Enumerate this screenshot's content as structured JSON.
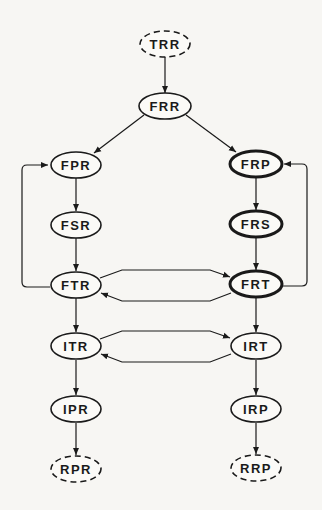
{
  "diagram": {
    "title": "",
    "nodes": [
      {
        "id": "TRR",
        "label": "TRR",
        "cx": 165,
        "cy": 44,
        "style": "dashed"
      },
      {
        "id": "FRR",
        "label": "FRR",
        "cx": 165,
        "cy": 106,
        "style": "normal"
      },
      {
        "id": "FPR",
        "label": "FPR",
        "cx": 75,
        "cy": 165,
        "style": "normal"
      },
      {
        "id": "FRP",
        "label": "FRP",
        "cx": 255,
        "cy": 164,
        "style": "bold"
      },
      {
        "id": "FSR",
        "label": "FSR",
        "cx": 76,
        "cy": 225,
        "style": "normal"
      },
      {
        "id": "FRS",
        "label": "FRS",
        "cx": 256,
        "cy": 224,
        "style": "bold"
      },
      {
        "id": "FTR",
        "label": "FTR",
        "cx": 76,
        "cy": 285,
        "style": "normal"
      },
      {
        "id": "FRT",
        "label": "FRT",
        "cx": 256,
        "cy": 284,
        "style": "bold"
      },
      {
        "id": "ITR",
        "label": "ITR",
        "cx": 76,
        "cy": 346,
        "style": "normal"
      },
      {
        "id": "IRT",
        "label": "IRT",
        "cx": 256,
        "cy": 346,
        "style": "normal"
      },
      {
        "id": "IPR",
        "label": "IPR",
        "cx": 76,
        "cy": 409,
        "style": "normal"
      },
      {
        "id": "IRP",
        "label": "IRP",
        "cx": 256,
        "cy": 409,
        "style": "normal"
      },
      {
        "id": "RPR",
        "label": "RPR",
        "cx": 76,
        "cy": 469,
        "style": "dashed"
      },
      {
        "id": "RRP",
        "label": "RRP",
        "cx": 256,
        "cy": 468,
        "style": "dashed"
      }
    ],
    "edges": [
      {
        "from": "TRR",
        "to": "FRR"
      },
      {
        "from": "FRR",
        "to": "FPR"
      },
      {
        "from": "FRR",
        "to": "FRP"
      },
      {
        "from": "FPR",
        "to": "FSR"
      },
      {
        "from": "FSR",
        "to": "FTR"
      },
      {
        "from": "FTR",
        "to": "FPR",
        "kind": "loop-left"
      },
      {
        "from": "FRP",
        "to": "FRS"
      },
      {
        "from": "FRS",
        "to": "FRT"
      },
      {
        "from": "FRT",
        "to": "FRP",
        "kind": "loop-right"
      },
      {
        "from": "FTR",
        "to": "FRT"
      },
      {
        "from": "FRT",
        "to": "FTR"
      },
      {
        "from": "FTR",
        "to": "ITR"
      },
      {
        "from": "FRT",
        "to": "IRT"
      },
      {
        "from": "ITR",
        "to": "IRT"
      },
      {
        "from": "IRT",
        "to": "ITR"
      },
      {
        "from": "ITR",
        "to": "IPR"
      },
      {
        "from": "IRT",
        "to": "IRP"
      },
      {
        "from": "IPR",
        "to": "RPR"
      },
      {
        "from": "IRP",
        "to": "RRP"
      }
    ]
  },
  "labels": {
    "TRR": "TRR",
    "FRR": "FRR",
    "FPR": "FPR",
    "FRP": "FRP",
    "FSR": "FSR",
    "FRS": "FRS",
    "FTR": "FTR",
    "FRT": "FRT",
    "ITR": "ITR",
    "IRT": "IRT",
    "IPR": "IPR",
    "IRP": "IRP",
    "RPR": "RPR",
    "RRP": "RRP"
  }
}
